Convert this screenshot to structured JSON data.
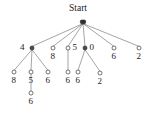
{
  "figure": {
    "kind": "tree-diagram",
    "root_label": "Start",
    "background_color": "#ffffff",
    "edge_color": "#5a5a58",
    "node_fill": "#ffffff",
    "node_stroke": "#3a3a38",
    "text_color": "#1d1d1b"
  },
  "chart_data": {
    "type": "tree",
    "title": "Start",
    "nodes": [
      {
        "id": "root",
        "label": "Start",
        "x": 83,
        "y": 22,
        "depth": 0,
        "parent": null,
        "style": "root"
      },
      {
        "id": "n1",
        "label": "4",
        "x": 32,
        "y": 48,
        "depth": 1,
        "parent": "root",
        "style": "dark",
        "label_side": "left"
      },
      {
        "id": "n2",
        "label": "8",
        "x": 53,
        "y": 48,
        "depth": 1,
        "parent": "root",
        "style": "open",
        "label_side": "below"
      },
      {
        "id": "n3",
        "label": "5",
        "x": 68,
        "y": 48,
        "depth": 1,
        "parent": "root",
        "style": "open",
        "label_side": "right"
      },
      {
        "id": "n4",
        "label": "0",
        "x": 85,
        "y": 48,
        "depth": 1,
        "parent": "root",
        "style": "dark",
        "label_side": "right"
      },
      {
        "id": "n5",
        "label": "6",
        "x": 114,
        "y": 48,
        "depth": 1,
        "parent": "root",
        "style": "open",
        "label_side": "below"
      },
      {
        "id": "n6",
        "label": "2",
        "x": 139,
        "y": 48,
        "depth": 1,
        "parent": "root",
        "style": "open",
        "label_side": "below"
      },
      {
        "id": "n1a",
        "label": "8",
        "x": 14,
        "y": 72,
        "depth": 2,
        "parent": "n1",
        "style": "open",
        "label_side": "below"
      },
      {
        "id": "n1b",
        "label": "5",
        "x": 31,
        "y": 72,
        "depth": 2,
        "parent": "n1",
        "style": "open",
        "label_side": "below"
      },
      {
        "id": "n1c",
        "label": "6",
        "x": 48,
        "y": 72,
        "depth": 2,
        "parent": "n1",
        "style": "open",
        "label_side": "below"
      },
      {
        "id": "n3a",
        "label": "6",
        "x": 68,
        "y": 72,
        "depth": 2,
        "parent": "n3",
        "style": "open",
        "label_side": "below"
      },
      {
        "id": "n4a",
        "label": "6",
        "x": 78,
        "y": 72,
        "depth": 2,
        "parent": "n4",
        "style": "open",
        "label_side": "below"
      },
      {
        "id": "n4b",
        "label": "2",
        "x": 100,
        "y": 73,
        "depth": 2,
        "parent": "n4",
        "style": "open",
        "label_side": "below"
      },
      {
        "id": "n1b1",
        "label": "6",
        "x": 31,
        "y": 93,
        "depth": 3,
        "parent": "n1b",
        "style": "open",
        "label_side": "below"
      }
    ],
    "edges": [
      {
        "from": "root",
        "to": "n1"
      },
      {
        "from": "root",
        "to": "n2"
      },
      {
        "from": "root",
        "to": "n3"
      },
      {
        "from": "root",
        "to": "n4"
      },
      {
        "from": "root",
        "to": "n5"
      },
      {
        "from": "root",
        "to": "n6"
      },
      {
        "from": "n1",
        "to": "n1a"
      },
      {
        "from": "n1",
        "to": "n1b"
      },
      {
        "from": "n1",
        "to": "n1c"
      },
      {
        "from": "n3",
        "to": "n3a"
      },
      {
        "from": "n4",
        "to": "n4a"
      },
      {
        "from": "n4",
        "to": "n4b"
      },
      {
        "from": "n1b",
        "to": "n1b1"
      }
    ],
    "labels": {
      "root": "Start",
      "level1": [
        "4",
        "8",
        "5",
        "0",
        "6",
        "2"
      ],
      "level2": [
        "8",
        "5",
        "6",
        "6",
        "6",
        "2"
      ],
      "level3": [
        "6"
      ]
    }
  }
}
